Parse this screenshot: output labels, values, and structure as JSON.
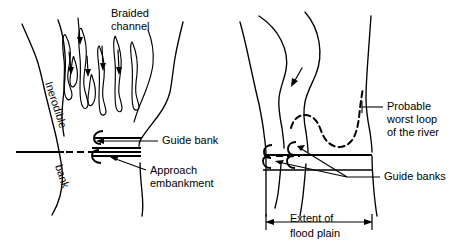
{
  "figure": {
    "background_color": "#ffffff",
    "ink_color": "#000000"
  },
  "panels": [
    {
      "id": "left-panel",
      "name": "braided-river-panel",
      "labels": {
        "braided_channel": "Braided\nchannel",
        "braided_channel_line1": "Braided",
        "braided_channel_line2": "channel",
        "inerodible": "Inerodible",
        "bank": "bank",
        "guide_bank": "Guide bank",
        "approach_embankment_line1": "Approach",
        "approach_embankment_line2": "embankment"
      }
    },
    {
      "id": "right-panel",
      "name": "meandering-river-panel",
      "labels": {
        "probable_worst_loop_line1": "Probable",
        "probable_worst_loop_line2": "worst loop",
        "probable_worst_loop_line3": "of the river",
        "guide_banks": "Guide banks",
        "extent_line1": "Extent of",
        "extent_line2": "flood plain"
      }
    }
  ]
}
